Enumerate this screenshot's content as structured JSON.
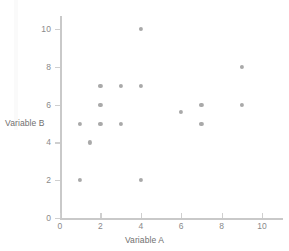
{
  "chart_data": {
    "type": "scatter",
    "title": "",
    "xlabel": "Variable A",
    "ylabel": "Variable B",
    "xlim": [
      0,
      11
    ],
    "ylim": [
      0,
      10.6
    ],
    "xticks": [
      0,
      2,
      4,
      6,
      8,
      10
    ],
    "yticks": [
      0,
      2,
      4,
      6,
      8,
      10
    ],
    "xtick_labels": [
      "0",
      "2",
      "4",
      "6",
      "8",
      "10"
    ],
    "ytick_labels": [
      "0",
      "2",
      "4",
      "6",
      "8",
      "10"
    ],
    "grid": false,
    "legend": null,
    "marker_color": "#a9a9a9",
    "axis_color": "#c9c9c9",
    "points": [
      {
        "x": 1,
        "y": 2
      },
      {
        "x": 1,
        "y": 5
      },
      {
        "x": 1.5,
        "y": 4
      },
      {
        "x": 2,
        "y": 5
      },
      {
        "x": 2,
        "y": 6
      },
      {
        "x": 2,
        "y": 7
      },
      {
        "x": 3,
        "y": 5
      },
      {
        "x": 3,
        "y": 7
      },
      {
        "x": 4,
        "y": 2
      },
      {
        "x": 4,
        "y": 7
      },
      {
        "x": 4,
        "y": 10
      },
      {
        "x": 6,
        "y": 5.6
      },
      {
        "x": 7,
        "y": 5
      },
      {
        "x": 7,
        "y": 6
      },
      {
        "x": 9,
        "y": 6
      },
      {
        "x": 9,
        "y": 8
      }
    ]
  }
}
